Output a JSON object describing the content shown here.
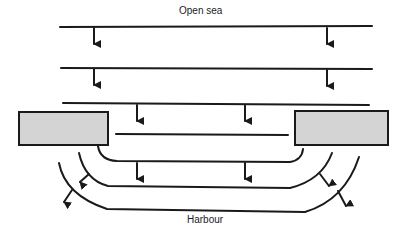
{
  "diagram": {
    "labels": {
      "top": "Open sea",
      "bottom": "Harbour"
    },
    "colors": {
      "line": "#1a1a1a",
      "breakwater_fill": "#d4d4d4"
    },
    "elements": {
      "incident_wavefronts": 3,
      "breakwaters": [
        "left-breakwater",
        "right-breakwater"
      ],
      "diffracted_wavefronts": 3
    }
  }
}
